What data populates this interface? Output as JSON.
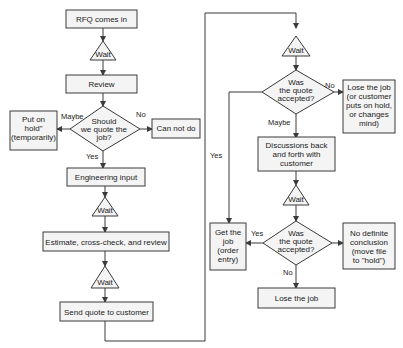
{
  "diagram": {
    "type": "flowchart",
    "nodes": {
      "rfq": {
        "label": "RFQ comes in"
      },
      "wait1": {
        "label": "Wait"
      },
      "review": {
        "label": "Review"
      },
      "should_quote": {
        "lines": [
          "Should",
          "we quote the",
          "job?"
        ]
      },
      "put_on_hold": {
        "lines": [
          "Put on",
          "hold\"",
          "(temporarily)"
        ]
      },
      "can_not_do": {
        "label": "Can not do"
      },
      "engineering": {
        "label": "Engineering input"
      },
      "wait2": {
        "label": "Wait"
      },
      "estimate": {
        "label": "Estimate, cross-check, and review"
      },
      "wait3": {
        "label": "Wait"
      },
      "send_quote": {
        "label": "Send quote to customer"
      },
      "wait4": {
        "label": "Wait"
      },
      "accepted1": {
        "lines": [
          "Was",
          "the quote",
          "accepted?"
        ]
      },
      "lose_job_1": {
        "lines": [
          "Lose the job",
          "(or customer",
          "puts on hold,",
          "or changes",
          "mind)"
        ]
      },
      "discussions": {
        "lines": [
          "Discussions back",
          "and forth with",
          "customer"
        ]
      },
      "wait5": {
        "label": "Wait"
      },
      "accepted2": {
        "lines": [
          "Was",
          "the quote",
          "accepted?"
        ]
      },
      "get_job": {
        "lines": [
          "Get the",
          "job",
          "(order",
          "entry)"
        ]
      },
      "no_conclusion": {
        "lines": [
          "No definite",
          "conclusion",
          "(move file",
          "to \"hold\")"
        ]
      },
      "lose_job_2": {
        "label": "Lose the job"
      }
    },
    "edge_labels": {
      "maybe1": "Maybe",
      "no1": "No",
      "yes1": "Yes",
      "no2": "No",
      "maybe2": "Maybe",
      "yes2": "Yes",
      "yes3": "Yes",
      "no3": "No"
    }
  }
}
